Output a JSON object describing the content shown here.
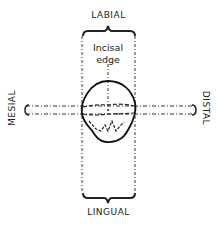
{
  "diagram": {
    "labels": {
      "top": "LABIAL",
      "bottom": "LINGUAL",
      "left": "MESIAL",
      "right": "DISTAL",
      "center_line1": "Incisal",
      "center_line2": "edge"
    },
    "colors": {
      "ink": "#222222",
      "background": "#ffffff"
    }
  }
}
